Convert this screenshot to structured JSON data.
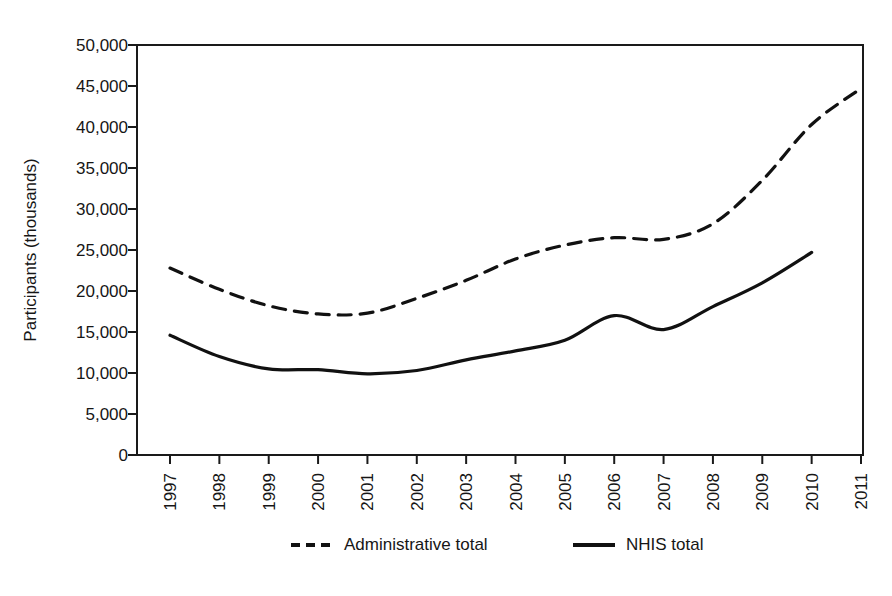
{
  "chart_data": {
    "type": "line",
    "title": "",
    "xlabel": "",
    "ylabel": "Participants (thousands)",
    "categories": [
      "1997",
      "1998",
      "1999",
      "2000",
      "2001",
      "2002",
      "2003",
      "2004",
      "2005",
      "2006",
      "2007",
      "2008",
      "2009",
      "2010",
      "2011"
    ],
    "x": [
      1997,
      1998,
      1999,
      2000,
      2001,
      2002,
      2003,
      2004,
      2005,
      2006,
      2007,
      2008,
      2009,
      2010,
      2011
    ],
    "ylim": [
      0,
      50000
    ],
    "xlim": [
      1997,
      2011
    ],
    "grid": false,
    "legend_position": "bottom",
    "y_ticks": [
      0,
      5000,
      10000,
      15000,
      20000,
      25000,
      30000,
      35000,
      40000,
      45000,
      50000
    ],
    "y_tick_labels": [
      "0",
      "5,000",
      "10,000",
      "15,000",
      "20,000",
      "25,000",
      "30,000",
      "35,000",
      "40,000",
      "45,000",
      "50,000"
    ],
    "series": [
      {
        "name": "Administrative total",
        "style": "dashed",
        "color": "#111111",
        "values": [
          22800,
          20200,
          18200,
          17200,
          17300,
          19100,
          21300,
          23900,
          25600,
          26500,
          26300,
          28200,
          33500,
          40300,
          44700
        ]
      },
      {
        "name": "NHIS total",
        "style": "solid",
        "color": "#111111",
        "values": [
          14600,
          12000,
          10500,
          10400,
          9900,
          10300,
          11600,
          12700,
          14000,
          17000,
          15300,
          18100,
          21000,
          24700,
          null
        ]
      }
    ]
  },
  "legend": {
    "items": [
      {
        "label": "Administrative total",
        "style": "dashed"
      },
      {
        "label": "NHIS total",
        "style": "solid"
      }
    ]
  }
}
